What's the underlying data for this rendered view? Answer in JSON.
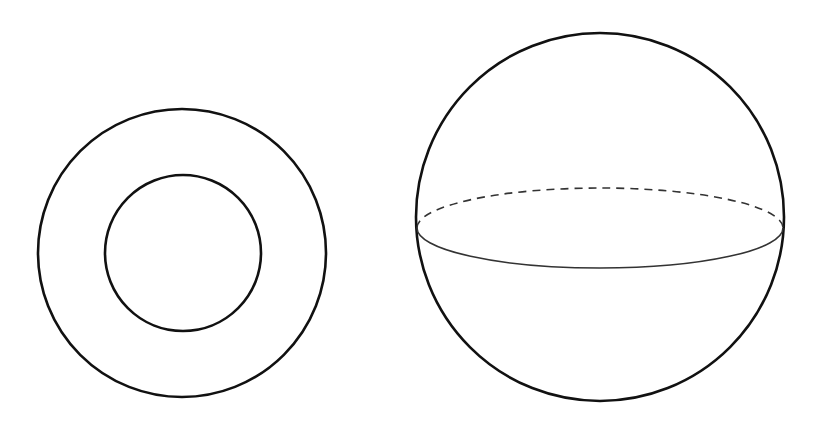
{
  "diagram": {
    "background": "#ffffff",
    "stroke_color": "#111111",
    "annulus": {
      "outer": {
        "cx": 182,
        "cy": 253,
        "r": 144
      },
      "inner": {
        "cx": 183,
        "cy": 253,
        "r": 78
      }
    },
    "sphere": {
      "outline": {
        "cx": 600,
        "cy": 217,
        "r": 184
      },
      "equator": {
        "cx": 600,
        "cy": 228,
        "rx": 183,
        "ry": 40,
        "back_style": "dashed",
        "front_style": "solid"
      }
    }
  }
}
